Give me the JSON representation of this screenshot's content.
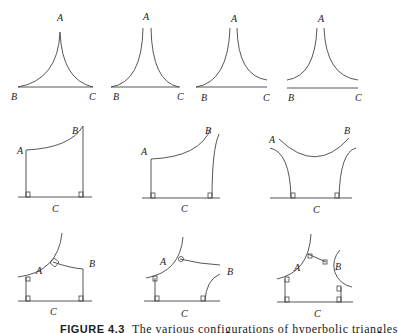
{
  "figure": {
    "caption_label": "FIGURE 4.3",
    "caption_text": "The various configurations of hyperbolic triangles"
  },
  "row1": [
    {
      "A": "A",
      "B": "B",
      "C": "C"
    },
    {
      "A": "A",
      "B": "B",
      "C": "C"
    },
    {
      "A": "A",
      "B": "B",
      "C": "C"
    },
    {
      "A": "A",
      "B": "B",
      "C": "C"
    }
  ],
  "row2": [
    {
      "A": "A",
      "B": "B",
      "C": "C"
    },
    {
      "A": "A",
      "B": "B",
      "C": "C"
    },
    {
      "A": "A",
      "B": "B",
      "C": "C"
    }
  ],
  "row3": [
    {
      "A": "A",
      "B": "B",
      "C": "C"
    },
    {
      "A": "A",
      "B": "B",
      "C": "C"
    },
    {
      "A": "A",
      "B": "B",
      "C": "C"
    }
  ]
}
